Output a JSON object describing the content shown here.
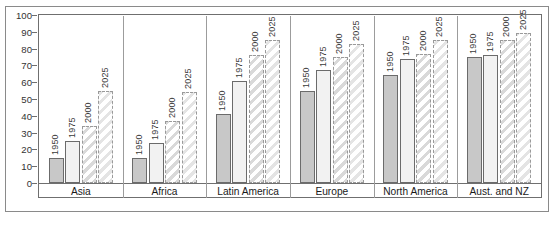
{
  "chart_data": {
    "type": "bar",
    "title": "Percentage of population in urban areas, 1950–75, and projections for 2000–25",
    "title_line1": "Percentage of population in urban areas, 1950–75, and projections",
    "title_line2": "for 2000–25",
    "xlabel": "",
    "ylabel": "",
    "ylim": [
      0,
      100
    ],
    "grid": false,
    "legend_position": "none",
    "yticks": [
      0,
      10,
      20,
      30,
      40,
      50,
      60,
      70,
      80,
      90,
      100
    ],
    "ytick_labels": [
      "0",
      "10",
      "20",
      "30",
      "40",
      "50",
      "60",
      "70",
      "80",
      "90",
      "100"
    ],
    "categories": [
      "Asia",
      "Africa",
      "Latin America",
      "Europe",
      "North America",
      "Aust. and NZ"
    ],
    "series": [
      {
        "name": "1950",
        "style": "solid-grey",
        "values": [
          15,
          15,
          41,
          55,
          64,
          75
        ]
      },
      {
        "name": "1975",
        "style": "solid-light",
        "values": [
          25,
          24,
          61,
          67,
          74,
          76
        ]
      },
      {
        "name": "2000",
        "style": "hatched",
        "values": [
          34,
          37,
          76,
          75,
          77,
          85
        ]
      },
      {
        "name": "2025",
        "style": "hatched-open",
        "values": [
          55,
          54,
          85,
          83,
          85,
          89
        ]
      }
    ],
    "bar_value_labels": [
      {
        "category": "Asia",
        "labels": [
          "1950",
          "1975",
          "2000",
          "2025"
        ]
      },
      {
        "category": "Africa",
        "labels": [
          "1950",
          "1975",
          "2000",
          "2025"
        ]
      },
      {
        "category": "Latin America",
        "labels": [
          "1950",
          "1975",
          "2000",
          "2025"
        ]
      },
      {
        "category": "Europe",
        "labels": [
          "1950",
          "1975",
          "2000",
          "2025"
        ]
      },
      {
        "category": "North America",
        "labels": [
          "1950",
          "1975",
          "2000",
          "2025"
        ]
      },
      {
        "category": "Aust. and NZ",
        "labels": [
          "1950",
          "1975",
          "2000",
          "2025"
        ]
      }
    ],
    "colors": {
      "bar_1950_fill": "#c8c8c8",
      "bar_1975_fill": "#f2f2f2",
      "bar_2000_hatch": "#d9d9d9",
      "bar_2025_hatch": "#e4e4e4",
      "border": "#6b6b6b",
      "projection_border": "#9a9a9a",
      "text": "#1a1a1a",
      "background": "#ffffff"
    }
  }
}
